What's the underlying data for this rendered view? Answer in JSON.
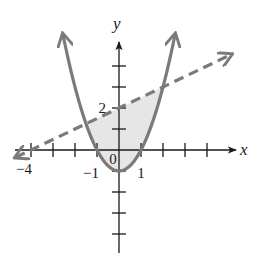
{
  "chart_data": {
    "type": "line",
    "title": "",
    "xlabel": "x",
    "ylabel": "y",
    "xlim": [
      -4.7,
      5.1
    ],
    "ylim": [
      -4.8,
      5.5
    ],
    "grid": false,
    "legend": null,
    "x_tick_values": [
      -4,
      -3,
      -2,
      -1,
      1,
      2,
      3,
      4
    ],
    "y_tick_values": [
      -4,
      -3,
      -2,
      -1,
      1,
      2,
      3,
      4
    ],
    "tick_labels": {
      "x": [
        {
          "value": -4,
          "label": "−4"
        },
        {
          "value": -1,
          "label": "−1"
        },
        {
          "value": 1,
          "label": "1"
        }
      ],
      "y": [
        {
          "value": 2,
          "label": "2"
        }
      ],
      "origin": "0"
    },
    "series": [
      {
        "name": "parabola",
        "equation": "y = x^2 - 1",
        "style": "solid",
        "color": "#7a7a7a",
        "x_range": [
          -2.55,
          2.55
        ],
        "points": [
          [
            -2.5,
            5.25
          ],
          [
            -2,
            3
          ],
          [
            -1.5,
            1.25
          ],
          [
            -1,
            0
          ],
          [
            -0.5,
            -0.75
          ],
          [
            0,
            -1
          ],
          [
            0.5,
            -0.75
          ],
          [
            1,
            0
          ],
          [
            1.5,
            1.25
          ],
          [
            2,
            3
          ],
          [
            2.5,
            5.25
          ]
        ],
        "arrows": "both"
      },
      {
        "name": "line",
        "equation": "y = 0.5x + 2",
        "style": "dashed",
        "color": "#7a7a7a",
        "x_range": [
          -4.7,
          5.1
        ],
        "points": [
          [
            -4,
            0
          ],
          [
            0,
            2
          ],
          [
            2,
            3
          ]
        ],
        "arrows": "both"
      }
    ],
    "shaded_region": {
      "description": "Region between the line (above) and the parabola (below)",
      "x_range": [
        -1.5,
        2
      ],
      "intersections": [
        [
          -1.5,
          1.25
        ],
        [
          2,
          3
        ]
      ],
      "color": "#e6e6e6"
    },
    "colors": {
      "axes": "#1a1a1a",
      "curve": "#7a7a7a",
      "fill": "#e6e6e6"
    }
  }
}
